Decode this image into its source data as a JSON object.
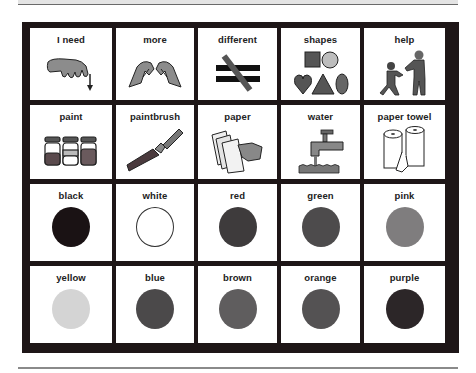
{
  "board": {
    "rows": [
      [
        {
          "label": "I need",
          "icon": "hand-pointing-down-icon"
        },
        {
          "label": "more",
          "icon": "hands-together-icon"
        },
        {
          "label": "different",
          "icon": "not-equal-icon"
        },
        {
          "label": "shapes",
          "icon": "shapes-icon"
        },
        {
          "label": "help",
          "icon": "people-helping-icon"
        }
      ],
      [
        {
          "label": "paint",
          "icon": "paint-jars-icon"
        },
        {
          "label": "paintbrush",
          "icon": "paintbrush-icon"
        },
        {
          "label": "paper",
          "icon": "paper-sheets-icon"
        },
        {
          "label": "water",
          "icon": "faucet-icon"
        },
        {
          "label": "paper towel",
          "icon": "paper-towel-roll-icon"
        }
      ],
      [
        {
          "label": "black",
          "icon": "color-circle-icon",
          "color": "#1a1214"
        },
        {
          "label": "white",
          "icon": "color-circle-icon",
          "color": "#ffffff"
        },
        {
          "label": "red",
          "icon": "color-circle-icon",
          "color": "#3e3b3c"
        },
        {
          "label": "green",
          "icon": "color-circle-icon",
          "color": "#4d4b4c"
        },
        {
          "label": "pink",
          "icon": "color-circle-icon",
          "color": "#7f7d7e"
        }
      ],
      [
        {
          "label": "yellow",
          "icon": "color-circle-icon",
          "color": "#d4d4d4"
        },
        {
          "label": "blue",
          "icon": "color-circle-icon",
          "color": "#4b494a"
        },
        {
          "label": "brown",
          "icon": "color-circle-icon",
          "color": "#5f5d5e"
        },
        {
          "label": "orange",
          "icon": "color-circle-icon",
          "color": "#545253"
        },
        {
          "label": "purple",
          "icon": "color-circle-icon",
          "color": "#2c2628"
        }
      ]
    ]
  },
  "colors": {
    "board_frame": "#1e1617",
    "cell_background": "#ffffff",
    "label_text": "#222222"
  }
}
